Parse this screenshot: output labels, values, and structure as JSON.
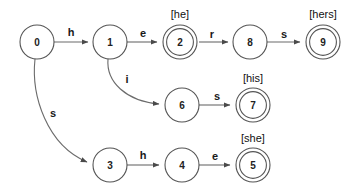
{
  "diagram": {
    "type": "state-machine-trie",
    "canvas": {
      "width": 358,
      "height": 193
    },
    "colors": {
      "background": "#ffffff",
      "node_stroke": "#555555",
      "edge_stroke": "#6b6b6b",
      "text": "#1a1a1a"
    },
    "nodes": [
      {
        "id": "0",
        "label": "0",
        "x": 37,
        "y": 42,
        "r": 17,
        "accepting": false,
        "output": null
      },
      {
        "id": "1",
        "label": "1",
        "x": 110,
        "y": 42,
        "r": 17,
        "accepting": false,
        "output": null
      },
      {
        "id": "2",
        "label": "2",
        "x": 180,
        "y": 42,
        "r": 17,
        "accepting": true,
        "output": "[he]",
        "output_x": 180,
        "output_y": 14
      },
      {
        "id": "8",
        "label": "8",
        "x": 250,
        "y": 42,
        "r": 17,
        "accepting": false,
        "output": null
      },
      {
        "id": "9",
        "label": "9",
        "x": 323,
        "y": 42,
        "r": 17,
        "accepting": true,
        "output": "[hers]",
        "output_x": 323,
        "output_y": 14
      },
      {
        "id": "6",
        "label": "6",
        "x": 182,
        "y": 105,
        "r": 17,
        "accepting": false,
        "output": null
      },
      {
        "id": "7",
        "label": "7",
        "x": 253,
        "y": 105,
        "r": 17,
        "accepting": true,
        "output": "[his]",
        "output_x": 253,
        "output_y": 78
      },
      {
        "id": "3",
        "label": "3",
        "x": 110,
        "y": 165,
        "r": 17,
        "accepting": false,
        "output": null
      },
      {
        "id": "4",
        "label": "4",
        "x": 182,
        "y": 165,
        "r": 17,
        "accepting": false,
        "output": null
      },
      {
        "id": "5",
        "label": "5",
        "x": 253,
        "y": 165,
        "r": 17,
        "accepting": true,
        "output": "[she]",
        "output_x": 253,
        "output_y": 138
      }
    ],
    "edges": [
      {
        "from": "0",
        "to": "1",
        "label": "h",
        "label_x": 71,
        "label_y": 32,
        "path": "M 54 42 L 88 42",
        "curved": false
      },
      {
        "from": "1",
        "to": "2",
        "label": "e",
        "label_x": 143,
        "label_y": 33,
        "path": "M 127 42 L 157 42",
        "curved": false
      },
      {
        "from": "2",
        "to": "8",
        "label": "r",
        "label_x": 212,
        "label_y": 34,
        "path": "M 199 42 L 228 42",
        "curved": false
      },
      {
        "from": "8",
        "to": "9",
        "label": "s",
        "label_x": 284,
        "label_y": 34,
        "path": "M 267 42 L 300 42",
        "curved": false
      },
      {
        "from": "1",
        "to": "6",
        "label": "i",
        "label_x": 127,
        "label_y": 79,
        "path": "M 108 59 C 106 82 126 101 159 104",
        "curved": true
      },
      {
        "from": "6",
        "to": "7",
        "label": "s",
        "label_x": 217,
        "label_y": 96,
        "path": "M 199 105 L 230 105",
        "curved": false
      },
      {
        "from": "0",
        "to": "3",
        "label": "s",
        "label_x": 53,
        "label_y": 113,
        "path": "M 35 59 C 31 96 47 145 87 162",
        "curved": true
      },
      {
        "from": "3",
        "to": "4",
        "label": "h",
        "label_x": 143,
        "label_y": 155,
        "path": "M 127 165 L 159 165",
        "curved": false
      },
      {
        "from": "4",
        "to": "5",
        "label": "e",
        "label_x": 215,
        "label_y": 156,
        "path": "M 199 165 L 230 165",
        "curved": false
      }
    ],
    "patterns": [
      "he",
      "hers",
      "his",
      "she"
    ]
  }
}
